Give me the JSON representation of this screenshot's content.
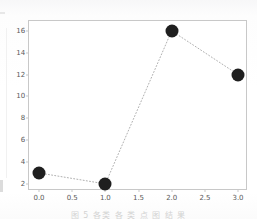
{
  "figure": {
    "caption": "图 5 各类 各 类 点 图 结 果",
    "background_color": "#ffffff",
    "frame_color": "#c8c8c8"
  },
  "chart_data": {
    "type": "scatter",
    "title": "",
    "xlabel": "",
    "ylabel": "",
    "x": [
      0,
      1,
      2,
      3
    ],
    "values": [
      3,
      2,
      16,
      12
    ],
    "series": [
      {
        "name": "series-1",
        "values": [
          3,
          2,
          16,
          12
        ],
        "marker": "circle",
        "marker_color": "#1f1f1f",
        "marker_size": 13,
        "line_style": "dotted",
        "line_color": "#b0b0b0"
      }
    ],
    "xlim": [
      -0.15,
      3.15
    ],
    "ylim": [
      1.35,
      16.9
    ],
    "xticks": [
      0.0,
      0.5,
      1.0,
      1.5,
      2.0,
      2.5,
      3.0
    ],
    "xtick_labels": [
      "0.0",
      "0.5",
      "1.0",
      "1.5",
      "2.0",
      "2.5",
      "3.0"
    ],
    "yticks": [
      2,
      4,
      6,
      8,
      10,
      12,
      14,
      16
    ],
    "ytick_labels": [
      "2",
      "4",
      "6",
      "8",
      "10",
      "12",
      "14",
      "16"
    ],
    "grid": false,
    "legend": null,
    "legend_position": "none"
  }
}
